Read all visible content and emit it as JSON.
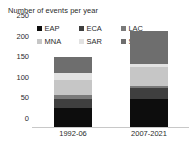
{
  "chart_data": {
    "type": "bar",
    "subtype": "stacked-column",
    "title": "Number of events per year",
    "xlabel": "",
    "ylabel": "",
    "ylim": [
      0,
      250
    ],
    "ytick_labels": [
      "0",
      "50",
      "100",
      "150",
      "200",
      "250"
    ],
    "ytick_values": [
      0,
      50,
      100,
      150,
      200,
      250
    ],
    "grid": false,
    "legend_position": "top",
    "categories": [
      "1992-06",
      "2007-2021"
    ],
    "series": [
      {
        "name": "EAP",
        "color": "#0d0d0d",
        "values": [
          45,
          68
        ]
      },
      {
        "name": "ECA",
        "color": "#3f3f3f",
        "values": [
          23,
          27
        ]
      },
      {
        "name": "LAC",
        "color": "#7a7a7a",
        "values": [
          10,
          5
        ]
      },
      {
        "name": "MNA",
        "color": "#c6c6c6",
        "values": [
          35,
          45
        ]
      },
      {
        "name": "SAR",
        "color": "#e2e2e2",
        "values": [
          17,
          7
        ]
      },
      {
        "name": "SSA",
        "color": "#6e6e6e",
        "values": [
          41,
          81
        ]
      }
    ],
    "totals": [
      171,
      233
    ]
  },
  "colors": {
    "axis": "#c8c8c8",
    "text": "#2b2b2b",
    "background": "#ffffff"
  }
}
